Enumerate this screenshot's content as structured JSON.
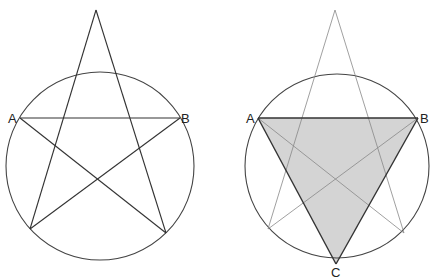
{
  "colors": {
    "stroke": "#333333",
    "thin_stroke": "#888888",
    "fill": "#d4d4d4",
    "background": "#ffffff"
  },
  "figures": [
    {
      "name": "pentagram-in-circle",
      "circle": {
        "cx": 100,
        "cy": 166,
        "r": 94
      },
      "star_points": {
        "apex": [
          96,
          10
        ],
        "A": [
          20,
          118
        ],
        "B": [
          180,
          118
        ],
        "bottom_left": [
          30,
          229
        ],
        "bottom_right": [
          166,
          233
        ]
      },
      "labels": {
        "A": "A",
        "B": "B"
      }
    },
    {
      "name": "triangle-in-pentagram",
      "circle": {
        "cx": 337,
        "cy": 166,
        "r": 92
      },
      "star_points": {
        "apex": [
          335,
          10
        ],
        "A": [
          258,
          118
        ],
        "B": [
          418,
          118
        ],
        "bottom_left": [
          268,
          229
        ],
        "bottom_right": [
          404,
          233
        ]
      },
      "triangle": {
        "A": [
          258,
          118
        ],
        "B": [
          418,
          118
        ],
        "C": [
          336,
          264
        ]
      },
      "labels": {
        "A": "A",
        "B": "B",
        "C": "C"
      }
    }
  ]
}
